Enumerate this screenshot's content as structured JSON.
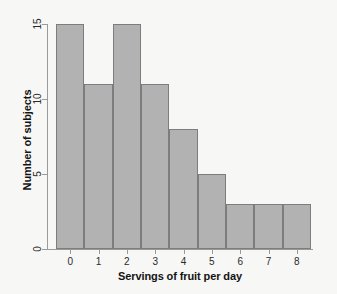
{
  "chart_data": {
    "type": "bar",
    "title": "",
    "subtitle": "",
    "xlabel": "Servings of fruit per day",
    "ylabel": "Number of subjects",
    "categories": [
      "0",
      "1",
      "2",
      "3",
      "4",
      "5",
      "6",
      "7",
      "8"
    ],
    "values": [
      15,
      11,
      15,
      11,
      8,
      5,
      3,
      3,
      3
    ],
    "series": [
      {
        "name": "Number of subjects",
        "values": [
          15,
          11,
          15,
          11,
          8,
          5,
          3,
          3,
          3
        ]
      }
    ],
    "xtick_labels": [
      "0",
      "1",
      "2",
      "3",
      "4",
      "5",
      "6",
      "7",
      "8"
    ],
    "ytick_labels": [
      "0",
      "5",
      "10",
      "15"
    ],
    "ytick_values": [
      0,
      5,
      10,
      15
    ],
    "ylim": [
      0,
      15
    ],
    "xlim": [
      -0.5,
      8.5
    ],
    "grid": false,
    "legend": false,
    "bar_fill_color": "#b2b2b2",
    "bar_edge_color": "#7d7d7d",
    "axis_color": "#9a9a9a",
    "text_color": "#141414",
    "background_color": "#f7f7f6"
  }
}
